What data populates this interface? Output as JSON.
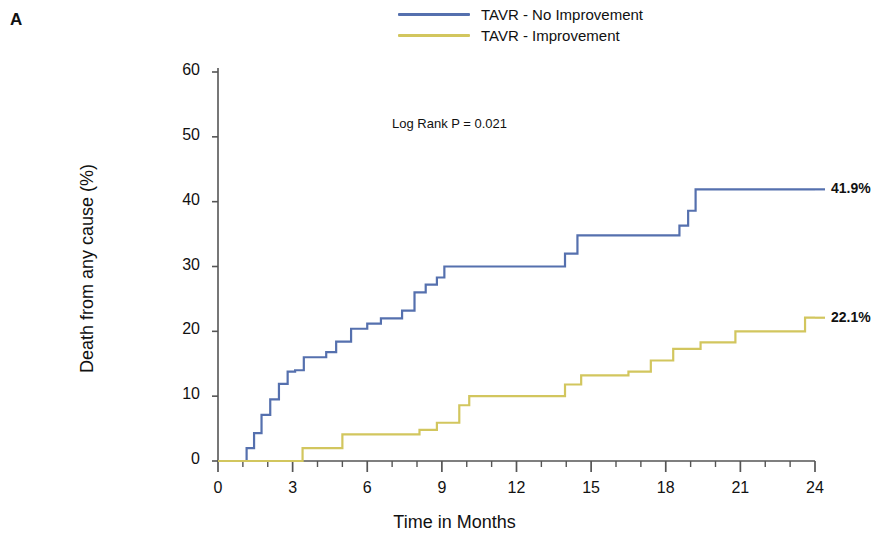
{
  "panel": {
    "label": "A"
  },
  "legend": {
    "position": "top-center",
    "entries": [
      {
        "label": "TAVR - No Improvement",
        "color": "#5570ae",
        "key": "no_improvement"
      },
      {
        "label": "TAVR - Improvement",
        "color": "#d2c65e",
        "key": "improvement"
      }
    ]
  },
  "annotation": {
    "text": "Log Rank P = 0.021"
  },
  "end_labels": [
    {
      "text": "41.9%",
      "color": "#5570ae"
    },
    {
      "text": "22.1%",
      "color": "#d2c65e"
    }
  ],
  "chart_data": {
    "type": "line",
    "subtype": "kaplan-meier-step",
    "title": "",
    "subtitle": "",
    "xlabel": "Time in Months",
    "ylabel": "Death from any cause (%)",
    "xlim": [
      0,
      24
    ],
    "ylim": [
      0,
      60
    ],
    "xticks": [
      0,
      3,
      6,
      9,
      12,
      15,
      18,
      21,
      24
    ],
    "xtick_labels": [
      "0",
      "3",
      "6",
      "9",
      "12",
      "15",
      "18",
      "21",
      "24"
    ],
    "xminor_interval": 1,
    "yticks": [
      0,
      10,
      20,
      30,
      40,
      50,
      60
    ],
    "ytick_labels": [
      "0",
      "10",
      "20",
      "30",
      "40",
      "50",
      "60"
    ],
    "grid": false,
    "legend_position": "top-center",
    "annotations": [
      {
        "text": "Log Rank P = 0.021",
        "x": 9.0,
        "y": 47.0
      },
      {
        "text": "41.9%",
        "x": 24.6,
        "y": 41.9
      },
      {
        "text": "22.1%",
        "x": 24.6,
        "y": 22.1
      }
    ],
    "series": [
      {
        "name": "TAVR - No Improvement",
        "color": "#5570ae",
        "final_value": 41.9,
        "x": [
          0,
          1.15,
          1.15,
          1.45,
          1.45,
          1.75,
          1.75,
          2.1,
          2.1,
          2.45,
          2.45,
          2.8,
          2.8,
          3.1,
          3.1,
          3.45,
          3.45,
          4.35,
          4.35,
          4.75,
          4.75,
          5.35,
          5.35,
          6.0,
          6.0,
          6.55,
          6.55,
          7.4,
          7.4,
          7.9,
          7.9,
          8.35,
          8.35,
          8.8,
          8.8,
          9.1,
          9.1,
          13.95,
          13.95,
          14.45,
          14.45,
          18.55,
          18.55,
          18.9,
          18.9,
          19.2,
          19.2,
          24.0
        ],
        "y": [
          0,
          0,
          2.0,
          2.0,
          4.3,
          4.3,
          7.1,
          7.1,
          9.5,
          9.5,
          11.9,
          11.9,
          13.8,
          13.8,
          14.0,
          14.0,
          16.0,
          16.0,
          16.8,
          16.8,
          18.4,
          18.4,
          20.4,
          20.4,
          21.2,
          21.2,
          22.0,
          22.0,
          23.2,
          23.2,
          26.0,
          26.0,
          27.2,
          27.2,
          28.3,
          28.3,
          30.0,
          30.0,
          32.0,
          32.0,
          34.8,
          34.8,
          36.3,
          36.3,
          38.6,
          38.6,
          41.9,
          41.9
        ]
      },
      {
        "name": "TAVR - Improvement",
        "color": "#d2c65e",
        "final_value": 22.1,
        "x": [
          0,
          3.4,
          3.4,
          5.0,
          5.0,
          8.1,
          8.1,
          8.8,
          8.8,
          9.7,
          9.7,
          10.1,
          10.1,
          13.95,
          13.95,
          14.6,
          14.6,
          16.5,
          16.5,
          17.4,
          17.4,
          18.3,
          18.3,
          19.4,
          19.4,
          20.8,
          20.8,
          23.6,
          23.6,
          24.0
        ],
        "y": [
          0,
          0,
          2.0,
          2.0,
          4.1,
          4.1,
          4.8,
          4.8,
          5.9,
          5.9,
          8.6,
          8.6,
          10.0,
          10.0,
          11.8,
          11.8,
          13.2,
          13.2,
          13.8,
          13.8,
          15.5,
          15.5,
          17.3,
          17.3,
          18.3,
          18.3,
          20.0,
          20.0,
          22.1,
          22.1
        ]
      }
    ]
  },
  "axes_geometry": {
    "x0_px": 218,
    "x1_px": 815,
    "y0_px": 461,
    "y1_px": 72
  }
}
